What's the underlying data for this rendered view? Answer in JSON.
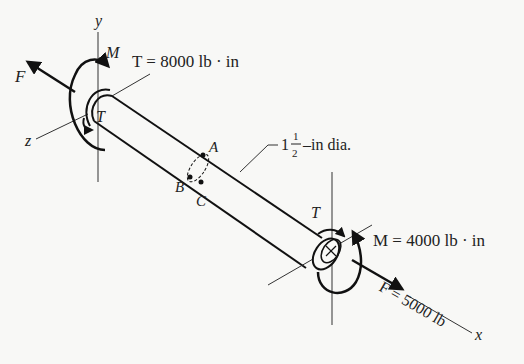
{
  "figure": {
    "type": "shaft-loading-diagram",
    "axes": {
      "x": "x",
      "y": "y",
      "z": "z"
    },
    "left_end": {
      "force_label": "F",
      "moment_label": "M",
      "torque_label": "T",
      "torque_value": "T = 8000 lb · in"
    },
    "right_end": {
      "torque_label": "T",
      "moment_value": "M = 4000 lb · in",
      "force_value": "F = 5000 lb"
    },
    "section_points": [
      "A",
      "B",
      "C"
    ],
    "diameter": {
      "whole": "1",
      "numerator": "1",
      "denominator": "2",
      "suffix": "–in dia."
    }
  },
  "colors": {
    "ink": "#1a1a1a",
    "thin": "#333333",
    "background": "#f8f8f6"
  }
}
